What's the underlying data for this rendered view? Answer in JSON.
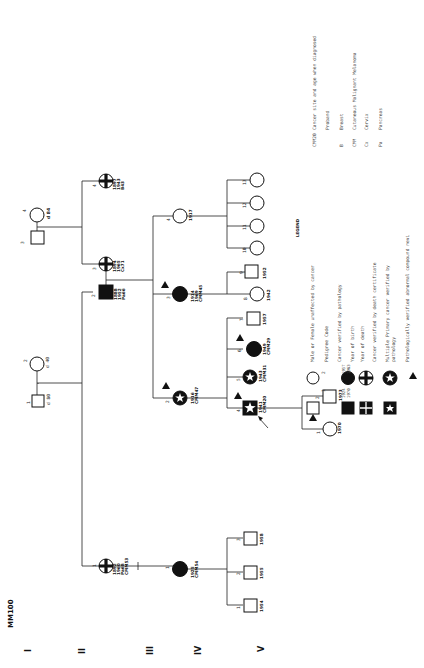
{
  "title": "MM100",
  "generations": [
    "I",
    "II",
    "III",
    "IV",
    "V"
  ],
  "legend": {
    "heading": "LEGEND",
    "items": [
      {
        "symbol": "open-square-circle",
        "left_label": "1",
        "right_label": "2",
        "text": "Male or Female unaffected by cancer"
      },
      {
        "symbol": "pedigree-code",
        "text": "Pedigree Code"
      },
      {
        "symbol": "filled-square-circle",
        "text": "Cancer verified by pathology"
      },
      {
        "symbol": "years",
        "birth": "1924",
        "death": "1970",
        "birth2": "1957",
        "death2": "1963",
        "text_birth": "Year of birth",
        "text_death": "Year of death"
      },
      {
        "symbol": "cross",
        "text": "Cancer verified by death certificate"
      },
      {
        "symbol": "star",
        "text": "Multiple Primary cancer verified by pathology"
      },
      {
        "symbol": "triangle",
        "text": "Pathologically verified abnormal compound nevi"
      }
    ],
    "abbreviations": [
      {
        "code": "CMM20",
        "meaning": "Cancer site and age when diagnosed"
      },
      {
        "code": "",
        "meaning": "Proband"
      },
      {
        "code": "B",
        "meaning": "Breast"
      },
      {
        "code": "CMM",
        "meaning": "Cutaneous Malignant Melanoma"
      },
      {
        "code": "Cx",
        "meaning": "Cervix"
      },
      {
        "code": "Pa",
        "meaning": "Pancreas"
      }
    ]
  },
  "persons": {
    "I_1": {
      "code": "1",
      "sex": "male",
      "status": "unaffected",
      "info": [
        "d 80"
      ]
    },
    "I_2": {
      "code": "2",
      "sex": "female",
      "status": "unaffected",
      "info": [
        "d 40"
      ]
    },
    "I_3": {
      "code": "3",
      "sex": "male",
      "status": "unaffected",
      "info": []
    },
    "I_4": {
      "code": "4",
      "sex": "female",
      "status": "unaffected",
      "info": [
        "d 84"
      ]
    },
    "II_1": {
      "code": "1",
      "sex": "female",
      "status": "death-certificate",
      "info": [
        "1892",
        "1960",
        "Pa68",
        "CMM53"
      ]
    },
    "II_2": {
      "code": "2",
      "sex": "male",
      "status": "pathology",
      "info": [
        "1888",
        "1952",
        "Pa66"
      ]
    },
    "II_3": {
      "code": "3",
      "sex": "female",
      "status": "death-certificate",
      "info": [
        "1894",
        "1965",
        "Cx71"
      ]
    },
    "II_4": {
      "code": "4",
      "sex": "female",
      "status": "death-certificate",
      "info": [
        "1897",
        "1943",
        "B43"
      ]
    },
    "III_1": {
      "code": "1",
      "sex": "female",
      "status": "pathology",
      "info": [
        "1925",
        "CMM54"
      ]
    },
    "III_2": {
      "code": "2",
      "sex": "female",
      "status": "multiple-primary",
      "nevi": true,
      "info": [
        "1916",
        "CMM47"
      ]
    },
    "III_3": {
      "code": "3",
      "sex": "female",
      "status": "pathology",
      "nevi": true,
      "info": [
        "1914",
        "1969",
        "CMM45"
      ]
    },
    "III_4": {
      "code": "4",
      "sex": "female",
      "status": "unaffected",
      "info": [
        "1917"
      ]
    },
    "IV_1": {
      "code": "1",
      "sex": "male",
      "status": "unaffected",
      "info": [
        "1954"
      ]
    },
    "IV_2": {
      "code": "2",
      "sex": "male",
      "status": "unaffected",
      "info": [
        "1955"
      ]
    },
    "IV_3": {
      "code": "3",
      "sex": "male",
      "status": "unaffected",
      "info": [
        "1958"
      ]
    },
    "IV_4": {
      "code": "4",
      "sex": "male",
      "status": "multiple-primary",
      "nevi": true,
      "proband": true,
      "info": [
        "1941",
        "CMM20"
      ]
    },
    "IV_5": {
      "code": "5",
      "sex": "female",
      "status": "multiple-primary",
      "info": [
        "1943",
        "CMM31"
      ]
    },
    "IV_6": {
      "code": "6",
      "sex": "female",
      "status": "pathology",
      "nevi": true,
      "info": [
        "1949",
        "CMM29"
      ]
    },
    "IV_7": {
      "code": "7",
      "sex": "male",
      "status": "unaffected",
      "info": [
        "1957"
      ]
    },
    "IV_8": {
      "code": "8",
      "sex": "female",
      "status": "unaffected",
      "info": [
        "1942"
      ]
    },
    "IV_9": {
      "code": "9",
      "sex": "male",
      "status": "unaffected",
      "info": [
        "1952"
      ]
    },
    "IV_10": {
      "code": "10",
      "sex": "female",
      "status": "unaffected",
      "info": []
    },
    "IV_11": {
      "code": "11",
      "sex": "female",
      "status": "unaffected",
      "info": []
    },
    "IV_12": {
      "code": "12",
      "sex": "female",
      "status": "unaffected",
      "info": []
    },
    "IV_13": {
      "code": "13",
      "sex": "female",
      "status": "unaffected",
      "info": []
    },
    "V_1": {
      "code": "1",
      "sex": "female",
      "status": "unaffected",
      "nevi": true,
      "info": [
        "1970"
      ]
    },
    "V_2": {
      "code": "2",
      "sex": "male",
      "status": "unaffected",
      "info": [
        "1973"
      ]
    }
  }
}
